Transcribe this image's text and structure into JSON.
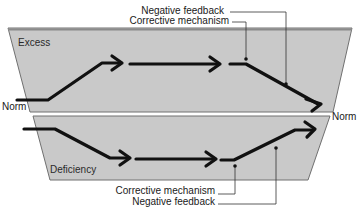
{
  "diagram": {
    "zones": {
      "upper": {
        "label": "Excess"
      },
      "lower": {
        "label": "Deficiency"
      }
    },
    "norm_labels": {
      "left": "Norm",
      "right": "Norm"
    },
    "annotations": {
      "top": {
        "negative_feedback": "Negative feedback",
        "corrective_mechanism": "Corrective mechanism"
      },
      "bottom": {
        "corrective_mechanism": "Corrective mechanism",
        "negative_feedback": "Negative feedback"
      }
    },
    "colors": {
      "zone_fill": "#c8c8c8",
      "zone_edge": "#6e6e6e",
      "arrow": "#111111",
      "leader": "#333333"
    }
  }
}
